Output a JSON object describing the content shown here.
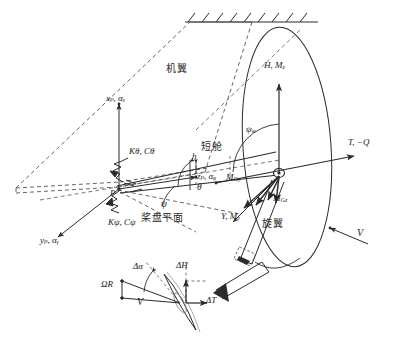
{
  "figure": {
    "type": "engineering-schematic",
    "background_color": "#ffffff",
    "line_color": "#2b2b2b",
    "dashed_color": "#555555"
  },
  "regions": {
    "wing_label": "机翼",
    "nacelle_label": "短舱",
    "rotor_label": "旋翼",
    "disc_plane_label": "桨盘平面"
  },
  "pivot": {
    "point_label": "P"
  },
  "axes": {
    "x_axis": "x",
    "x_axis_sub": "p",
    "x_alpha": "α",
    "x_alpha_sub": "x",
    "x_full": "xₚ, αₓ",
    "y_full": "yₚ, αᵧ",
    "z_full": "zₚ, αᵩ",
    "y_axis": "y",
    "z_axis": "z"
  },
  "springs": {
    "pitch": "K",
    "pitch_sub": "θ",
    "pitch_damp": "C",
    "pitch_damp_sub": "θ",
    "pitch_full": "Kθ, Cθ",
    "yaw_full": "Kψ, Cψ"
  },
  "angles": {
    "theta": "θ",
    "psi": "ψ",
    "psi_w": "ψ",
    "psi_w_sub": "w",
    "delta_alpha": "Δα"
  },
  "lengths": {
    "h": "h"
  },
  "hub_loads": {
    "H_Mz": "H, M",
    "H_Mz_sub": "z",
    "T_Q": "T, −Q",
    "Y_My": "Y, M",
    "Y_My_sub": "y",
    "M_Gy": "M",
    "M_Gy_sub": "Gy",
    "M_Gz": "M",
    "M_Gz_sub": "Gz"
  },
  "freestream": {
    "velocity": "V"
  },
  "detail_inset": {
    "omega_R": "ΩR",
    "velocity": "V",
    "delta_alpha": "Δα",
    "delta_H": "ΔH",
    "delta_T": "ΔT"
  }
}
